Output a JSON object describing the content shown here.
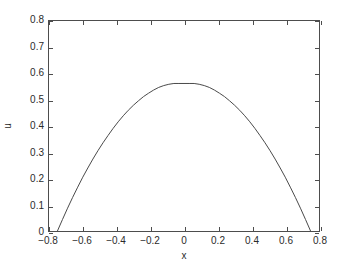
{
  "figure": {
    "background_color": "#ffffff",
    "axis_color": "#4d4d4d",
    "text_color": "#2b2b2b",
    "line_color": "#4a4a4a"
  },
  "axes": {
    "xlabel": "x",
    "ylabel": "u",
    "x_ticklabels": [
      "-0.8",
      "-0.6",
      "-0.4",
      "-0.2",
      "0",
      "0.2",
      "0.4",
      "0.6",
      "0.8"
    ],
    "y_ticklabels": [
      "0",
      "0.1",
      "0.2",
      "0.3",
      "0.4",
      "0.5",
      "0.6",
      "0.7",
      "0.8"
    ]
  },
  "chart_data": {
    "type": "line",
    "title": "",
    "subtitle": "",
    "xlabel": "x",
    "ylabel": "u",
    "xlim": [
      -0.8,
      0.8
    ],
    "ylim": [
      0,
      0.8
    ],
    "xticks": [
      -0.8,
      -0.6,
      -0.4,
      -0.2,
      0,
      0.2,
      0.4,
      0.6,
      0.8
    ],
    "yticks": [
      0,
      0.1,
      0.2,
      0.3,
      0.4,
      0.5,
      0.6,
      0.7,
      0.8
    ],
    "grid": false,
    "legend": null,
    "legend_position": "none",
    "box": true,
    "tick_direction": "in",
    "annotations": [],
    "series": [
      {
        "name": "u(x)",
        "color": "#4a4a4a",
        "linewidth": 1,
        "peak_x": 0.0,
        "peak_y": 0.562,
        "zero_crossings": [
          -0.75,
          0.75
        ],
        "x": [
          -0.75,
          -0.72,
          -0.69,
          -0.66,
          -0.63,
          -0.6,
          -0.57,
          -0.54,
          -0.51,
          -0.48,
          -0.45,
          -0.42,
          -0.39,
          -0.36,
          -0.33,
          -0.3,
          -0.27,
          -0.24,
          -0.21,
          -0.18,
          -0.15,
          -0.12,
          -0.09,
          -0.06,
          -0.03,
          0.0,
          0.03,
          0.06,
          0.09,
          0.12,
          0.15,
          0.18,
          0.21,
          0.24,
          0.27,
          0.3,
          0.33,
          0.36,
          0.39,
          0.42,
          0.45,
          0.48,
          0.51,
          0.54,
          0.57,
          0.6,
          0.63,
          0.66,
          0.69,
          0.72,
          0.75
        ],
        "y": [
          0.0,
          0.044,
          0.087,
          0.128,
          0.167,
          0.205,
          0.24,
          0.274,
          0.306,
          0.336,
          0.364,
          0.391,
          0.416,
          0.439,
          0.46,
          0.479,
          0.496,
          0.512,
          0.525,
          0.537,
          0.547,
          0.554,
          0.559,
          0.562,
          0.562,
          0.562,
          0.562,
          0.562,
          0.559,
          0.554,
          0.547,
          0.537,
          0.525,
          0.512,
          0.496,
          0.479,
          0.46,
          0.439,
          0.416,
          0.391,
          0.364,
          0.336,
          0.306,
          0.274,
          0.24,
          0.205,
          0.167,
          0.128,
          0.087,
          0.044,
          0.0
        ]
      }
    ]
  }
}
